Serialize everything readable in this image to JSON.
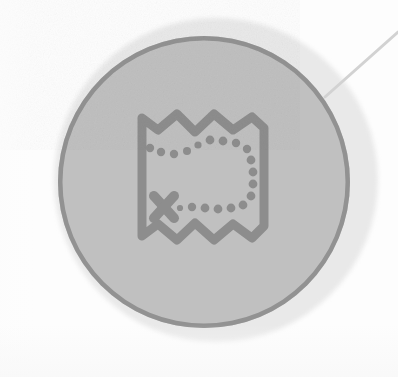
{
  "scene": {
    "title": "Map Badge",
    "description": "Circular gray badge containing a folded treasure-map icon with a dotted trail and an X marks-the-spot mark, with a thin leader line extending to the upper-right corner.",
    "width": 398,
    "height": 377,
    "background_color": "#fdfdfd"
  },
  "badge": {
    "halo": {
      "name": "outer-halo",
      "color": "#e9e9e9",
      "center_x": 216,
      "center_y": 180,
      "radius": 162
    },
    "disc": {
      "name": "badge-disc",
      "fill_color": "#c0c0c0",
      "border_color": "#929292",
      "border_width": 4.5,
      "center_x": 204,
      "center_y": 182,
      "radius": 146
    }
  },
  "icon": {
    "name": "map-icon",
    "label": "Treasure map",
    "color": "#8d8d8d",
    "stroke_width": 9,
    "bounds": {
      "x": 132,
      "y": 104,
      "width": 142,
      "height": 148
    },
    "features": [
      "folded-map-outline",
      "dotted-trail",
      "x-marks-the-spot"
    ],
    "trail_dot_count": 19,
    "marker_symbol": "X"
  },
  "leader": {
    "name": "callout-leader-line",
    "color": "#d2d2d2",
    "stroke_width": 3,
    "from_x": 398,
    "from_y": 32,
    "to_x": 325,
    "to_y": 97
  }
}
